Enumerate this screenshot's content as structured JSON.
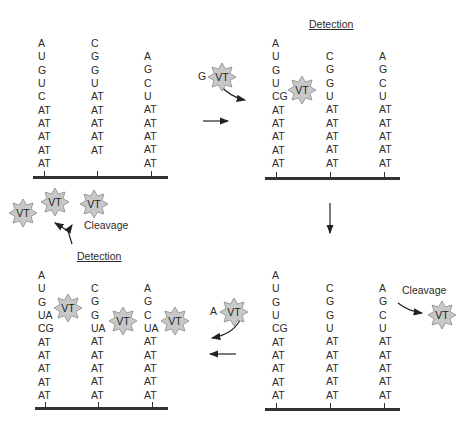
{
  "diagram": {
    "panels": [
      {
        "id": "panel-1",
        "title": "",
        "strands": [
          [
            "A",
            "U",
            "G",
            "U",
            "C",
            "AT",
            "AT",
            "AT",
            "AT",
            "AT"
          ],
          [
            "C",
            "G",
            "G",
            "U",
            "AT",
            "AT",
            "AT",
            "AT",
            "AT"
          ],
          [
            "A",
            "G",
            "C",
            "U",
            "AT",
            "AT",
            "AT",
            "AT",
            "AT"
          ]
        ]
      },
      {
        "id": "panel-2",
        "title": "Detection",
        "strands": [
          [
            "A",
            "U",
            "G",
            "U",
            "CG",
            "AT",
            "AT",
            "AT",
            "AT",
            "AT"
          ],
          [
            "C",
            "G",
            "G",
            "U",
            "AT",
            "AT",
            "AT",
            "AT",
            "AT"
          ],
          [
            "A",
            "G",
            "C",
            "U",
            "AT",
            "AT",
            "AT",
            "AT",
            "AT"
          ]
        ]
      },
      {
        "id": "panel-3",
        "title": "Detection",
        "strands": [
          [
            "A",
            "U",
            "G",
            "UA",
            "CG",
            "AT",
            "AT",
            "AT",
            "AT",
            "AT"
          ],
          [
            "C",
            "G",
            "G",
            "UA",
            "AT",
            "AT",
            "AT",
            "AT",
            "AT"
          ],
          [
            "A",
            "G",
            "C",
            "UA",
            "AT",
            "AT",
            "AT",
            "AT",
            "AT"
          ]
        ]
      },
      {
        "id": "panel-4",
        "title": "",
        "strands": [
          [
            "A",
            "U",
            "G",
            "U",
            "CG",
            "AT",
            "AT",
            "AT",
            "AT",
            "AT"
          ],
          [
            "C",
            "G",
            "G",
            "U",
            "AT",
            "AT",
            "AT",
            "AT",
            "AT"
          ],
          [
            "A",
            "G",
            "C",
            "U",
            "AT",
            "AT",
            "AT",
            "AT",
            "AT"
          ]
        ]
      }
    ],
    "probe_label": "VT",
    "incoming_nucleotides": {
      "top": "G",
      "bottom": "A"
    },
    "labels": {
      "cleavage_top_left": "Cleavage",
      "cleavage_right": "Cleavage"
    },
    "colors": {
      "text": "#2a2a2a",
      "baseline": "#333333",
      "star_fill": "#c8c8c8",
      "star_stroke": "#8a8a8a",
      "arrow": "#222222"
    }
  }
}
